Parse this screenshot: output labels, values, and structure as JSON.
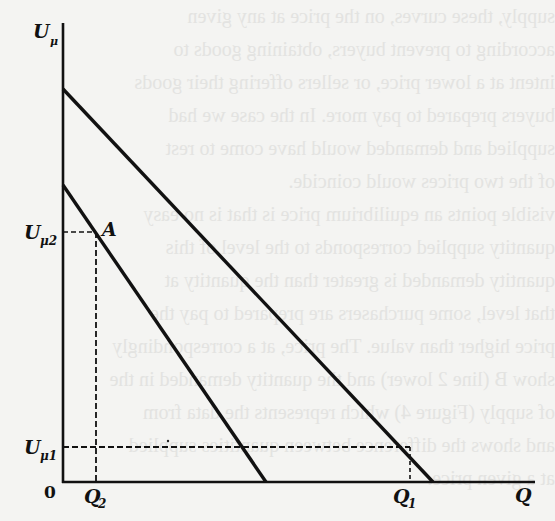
{
  "diagram": {
    "type": "economics-curve-shift",
    "axes": {
      "y_label": "U",
      "y_label_sub": "μ",
      "x_label": "Q",
      "origin_label": "0"
    },
    "levels": {
      "u_mu2": {
        "label": "U",
        "sub": "μ2"
      },
      "u_mu1": {
        "label": "U",
        "sub": "μ1"
      }
    },
    "quantities": {
      "q2": {
        "label": "Q",
        "sub": "2"
      },
      "q1": {
        "label": "Q",
        "sub": "1"
      }
    },
    "points": {
      "a": {
        "label": "A"
      }
    },
    "lines": [
      {
        "name": "lower-curve",
        "from": [
          63,
          185
        ],
        "to": [
          266,
          482
        ]
      },
      {
        "name": "upper-curve",
        "from": [
          63,
          89
        ],
        "to": [
          433,
          482
        ]
      }
    ],
    "colors": {
      "ink": "#111111",
      "paper": "#f4f4f2",
      "bleed": "#e3e3e1"
    }
  },
  "bleed_through_text": [
    "supply, these curves, on the price at any given",
    "according to prevent buyers, obtaining goods to",
    "intent at a lower price, or sellers offering their goods",
    "buyers prepared to pay more. In the case we had",
    "supplied and demanded would have come to rest",
    "of the two prices would coincide.",
    "visible points an equilibrium price is that is no easy",
    "quantity supplied corresponds to the level of this",
    "quantity demanded is greater than the quantity at",
    "that level, some purchasers are prepared to pay the",
    "price higher than value. The price, at a correspondingly",
    "show B (line 2 lower) and the quantity demanded in the",
    "of supply (Figure 4) which represents the data from",
    "and shows the difference between quantities supplied",
    "at a given price."
  ]
}
